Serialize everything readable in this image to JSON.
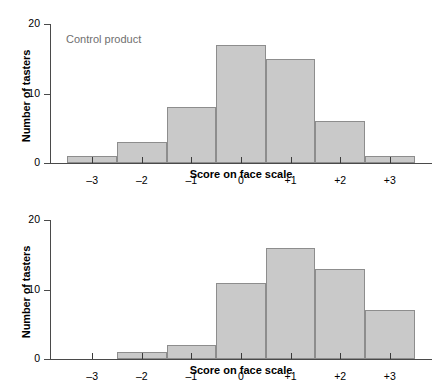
{
  "chart_data": [
    {
      "type": "bar",
      "title": "Control product",
      "xlabel": "Score on face scale",
      "ylabel": "Number of tasters",
      "categories": [
        "–3",
        "–2",
        "–1",
        "0",
        "+1",
        "+2",
        "+3"
      ],
      "values": [
        1,
        3,
        8,
        17,
        15,
        6,
        1
      ],
      "ylim": [
        0,
        20
      ],
      "yticks": [
        0,
        10,
        20
      ],
      "ytick_labels": [
        "0",
        "10",
        "20"
      ],
      "grid": false,
      "legend": "none",
      "bar_fill": "#c9c9c9",
      "bar_stroke": "#8d8d8d"
    },
    {
      "type": "bar",
      "title": "New product",
      "xlabel": "Score on face scale",
      "ylabel": "Number of tasters",
      "categories": [
        "–3",
        "–2",
        "–1",
        "0",
        "+1",
        "+2",
        "+3"
      ],
      "values": [
        0,
        1,
        2,
        11,
        16,
        13,
        7
      ],
      "ylim": [
        0,
        20
      ],
      "yticks": [
        0,
        10,
        20
      ],
      "ytick_labels": [
        "0",
        "10",
        "20"
      ],
      "grid": false,
      "legend": "none",
      "bar_fill": "#c9c9c9",
      "bar_stroke": "#8d8d8d"
    }
  ]
}
